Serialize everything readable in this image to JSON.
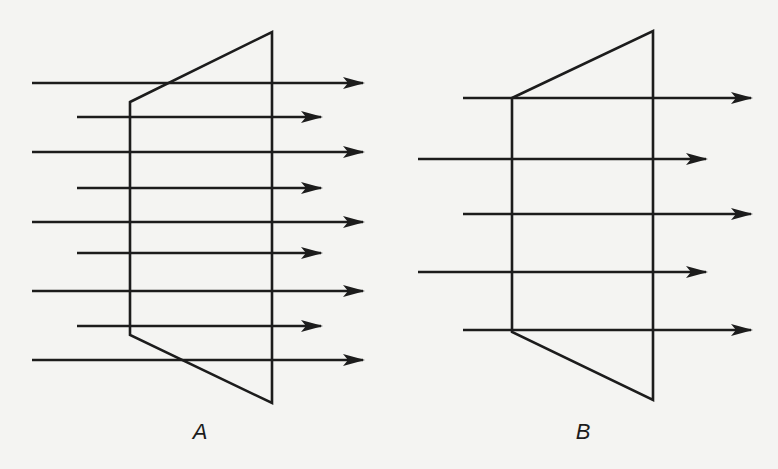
{
  "colors": {
    "background": "#f4f4f2",
    "stroke": "#1c1c1c"
  },
  "panels": [
    {
      "id": "A",
      "label": "A",
      "label_pos": [
        200,
        432
      ],
      "shape": [
        [
          130,
          102
        ],
        [
          272,
          32
        ],
        [
          272,
          403
        ],
        [
          130,
          335
        ]
      ],
      "rays": [
        {
          "y": 83,
          "x1": 32,
          "x2": 363,
          "kind": "long"
        },
        {
          "y": 117,
          "x1": 77,
          "x2": 321,
          "kind": "short"
        },
        {
          "y": 152,
          "x1": 32,
          "x2": 363,
          "kind": "long"
        },
        {
          "y": 188,
          "x1": 77,
          "x2": 321,
          "kind": "short"
        },
        {
          "y": 222,
          "x1": 32,
          "x2": 363,
          "kind": "long"
        },
        {
          "y": 253,
          "x1": 77,
          "x2": 321,
          "kind": "short"
        },
        {
          "y": 291,
          "x1": 32,
          "x2": 363,
          "kind": "long"
        },
        {
          "y": 326,
          "x1": 77,
          "x2": 321,
          "kind": "short"
        },
        {
          "y": 360,
          "x1": 32,
          "x2": 363,
          "kind": "long"
        }
      ]
    },
    {
      "id": "B",
      "label": "B",
      "label_pos": [
        583,
        432
      ],
      "shape": [
        [
          512,
          98
        ],
        [
          653,
          31
        ],
        [
          653,
          400
        ],
        [
          512,
          332
        ]
      ],
      "rays": [
        {
          "y": 98,
          "x1": 463,
          "x2": 751,
          "kind": "long"
        },
        {
          "y": 159,
          "x1": 418,
          "x2": 706,
          "kind": "short"
        },
        {
          "y": 214,
          "x1": 463,
          "x2": 751,
          "kind": "long"
        },
        {
          "y": 272,
          "x1": 418,
          "x2": 706,
          "kind": "short"
        },
        {
          "y": 330,
          "x1": 463,
          "x2": 751,
          "kind": "long"
        }
      ]
    }
  ]
}
